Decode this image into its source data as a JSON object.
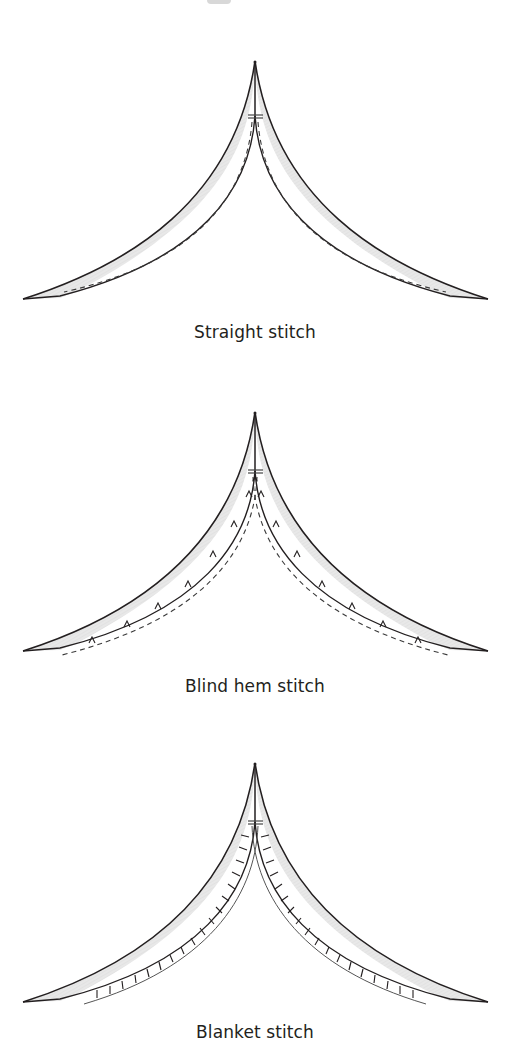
{
  "figure": {
    "panels": [
      {
        "id": "straight",
        "caption": "Straight stitch",
        "stitch_type": "straight"
      },
      {
        "id": "blind-hem",
        "caption": "Blind hem stitch",
        "stitch_type": "blind-hem"
      },
      {
        "id": "blanket",
        "caption": "Blanket stitch",
        "stitch_type": "blanket"
      }
    ]
  },
  "colors": {
    "fabric_fill": "#e6e6e6",
    "outline": "#231f20",
    "stitch": "#3a3a3a"
  }
}
